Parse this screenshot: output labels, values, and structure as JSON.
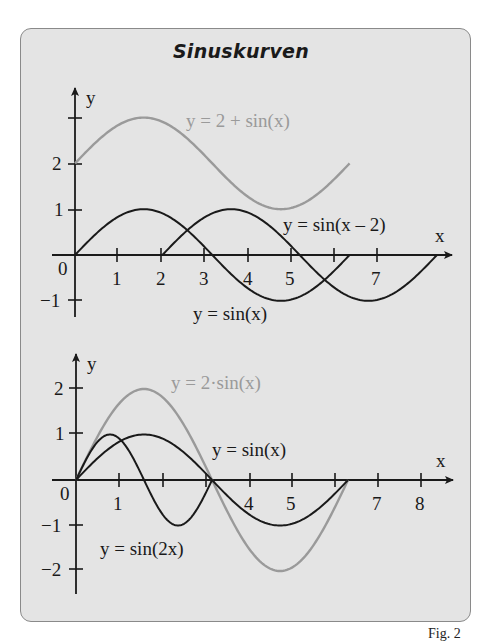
{
  "title": "Sinuskurven",
  "figure_label": "Fig. 2",
  "chart_data": [
    {
      "type": "line",
      "title": "Sinuskurven (oben)",
      "xlabel": "x",
      "ylabel": "y",
      "x_ticks": [
        1,
        2,
        3,
        4,
        5,
        6,
        7
      ],
      "x_tick_labels": [
        "1",
        "2",
        "3",
        "4",
        "5",
        "",
        "7"
      ],
      "y_ticks": [
        -1,
        1,
        2,
        3
      ],
      "y_tick_labels": [
        "−1",
        "1",
        "2",
        ""
      ],
      "origin_label": "0",
      "xlim": [
        -0.5,
        8.7
      ],
      "ylim": [
        -1.4,
        3.7
      ],
      "grid": false,
      "series": [
        {
          "name": "y = 2 + sin(x)",
          "label": "y = 2 + sin(x)",
          "color": "#9a9a9a",
          "domain": [
            0,
            6.283
          ],
          "expr": "2+sin(x)"
        },
        {
          "name": "y = sin(x − 2)",
          "label": "y = sin(x – 2)",
          "color": "#1a1a1a",
          "domain": [
            2,
            8.283
          ],
          "expr": "sin(x-2)"
        },
        {
          "name": "y = sin(x)",
          "label": "y = sin(x)",
          "color": "#1a1a1a",
          "domain": [
            0,
            6.283
          ],
          "expr": "sin(x)"
        }
      ]
    },
    {
      "type": "line",
      "title": "Sinuskurven (unten)",
      "xlabel": "x",
      "ylabel": "y",
      "x_ticks": [
        1,
        2,
        3,
        4,
        5,
        6,
        7,
        8
      ],
      "x_tick_labels": [
        "1",
        "",
        "",
        "4",
        "5",
        "",
        "7",
        "8"
      ],
      "y_ticks": [
        -2,
        -1,
        1,
        2
      ],
      "y_tick_labels": [
        "−2",
        "−1",
        "1",
        "2"
      ],
      "origin_label": "0",
      "xlim": [
        -0.5,
        8.7
      ],
      "ylim": [
        -2.5,
        2.8
      ],
      "grid": false,
      "series": [
        {
          "name": "y = 2·sin(x)",
          "label": "y = 2·sin(x)",
          "color": "#9a9a9a",
          "domain": [
            0,
            6.283
          ],
          "expr": "2*sin(x)"
        },
        {
          "name": "y = sin(x)",
          "label": "y = sin(x)",
          "color": "#1a1a1a",
          "domain": [
            0,
            6.283
          ],
          "expr": "sin(x)"
        },
        {
          "name": "y = sin(2x)",
          "label": "y = sin(2x)",
          "color": "#1a1a1a",
          "domain": [
            0,
            3.1416
          ],
          "expr": "sin(2*x)"
        }
      ]
    }
  ],
  "labels": {
    "top": {
      "y_axis": "y",
      "x_axis": "x",
      "origin": "0",
      "curve_2_plus_sin": "y = 2 + sin(x)",
      "curve_sin_shift": "y = sin(x – 2)",
      "curve_sin": "y = sin(x)",
      "xt1": "1",
      "xt2": "2",
      "xt3": "3",
      "xt4": "4",
      "xt5": "5",
      "xt7": "7",
      "yt2": "2",
      "yt1": "1",
      "ytm1": "−1"
    },
    "bottom": {
      "y_axis": "y",
      "x_axis": "x",
      "origin": "0",
      "curve_2sin": "y = 2·sin(x)",
      "curve_sin": "y = sin(x)",
      "curve_sin2x": "y = sin(2x)",
      "xt1": "1",
      "xt4": "4",
      "xt5": "5",
      "xt7": "7",
      "xt8": "8",
      "yt2": "2",
      "yt1": "1",
      "ytm1": "−1",
      "ytm2": "−2"
    }
  },
  "colors": {
    "frame_fill": "#e4e4e4",
    "frame_border": "#8a8a8a",
    "curve_dark": "#1a1a1a",
    "curve_gray": "#9a9a9a"
  }
}
